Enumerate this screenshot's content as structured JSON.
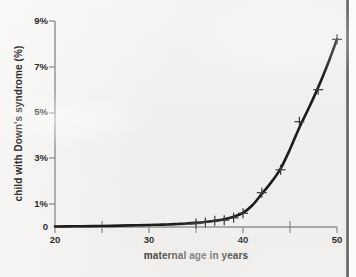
{
  "page": {
    "top_caption_remnant": "",
    "background_color": "#f1f0ee",
    "curve_color": "#1a1a1a",
    "axis_color": "#8a8a8a"
  },
  "chart_data": {
    "type": "line",
    "title": "",
    "xlabel": "maternal age in years",
    "ylabel": "child with Down's syndrome (%)",
    "xlim": [
      20,
      50
    ],
    "ylim": [
      0,
      9
    ],
    "grid": false,
    "legend": false,
    "xticks": [
      20,
      30,
      40,
      50
    ],
    "xtick_labels": [
      "20",
      "30",
      "40",
      "50"
    ],
    "xminor_ticks": [
      25,
      35,
      45
    ],
    "yticks": [
      0,
      1,
      3,
      5,
      7,
      9
    ],
    "ytick_labels": [
      "0",
      "1%",
      "3%",
      "5%",
      "7%",
      "9%"
    ],
    "marker": "plus",
    "series": [
      {
        "name": "child with Down's syndrome (%)",
        "x": [
          35,
          36,
          37,
          38,
          39,
          40,
          42,
          44,
          46,
          48,
          50
        ],
        "values": [
          0.15,
          0.2,
          0.27,
          0.3,
          0.4,
          0.6,
          1.5,
          2.5,
          4.6,
          6.0,
          8.2
        ]
      }
    ],
    "curve_x": [
      20,
      22,
      24,
      26,
      28,
      30,
      31,
      32,
      33,
      34,
      35,
      36,
      37,
      38,
      39,
      40,
      41,
      42,
      43,
      44,
      45,
      46,
      47,
      48,
      49,
      50
    ],
    "curve_y": [
      0.02,
      0.03,
      0.04,
      0.05,
      0.07,
      0.09,
      0.1,
      0.11,
      0.13,
      0.15,
      0.18,
      0.22,
      0.27,
      0.34,
      0.45,
      0.62,
      0.95,
      1.45,
      1.95,
      2.55,
      3.4,
      4.35,
      5.2,
      6.1,
      7.1,
      8.2
    ]
  }
}
